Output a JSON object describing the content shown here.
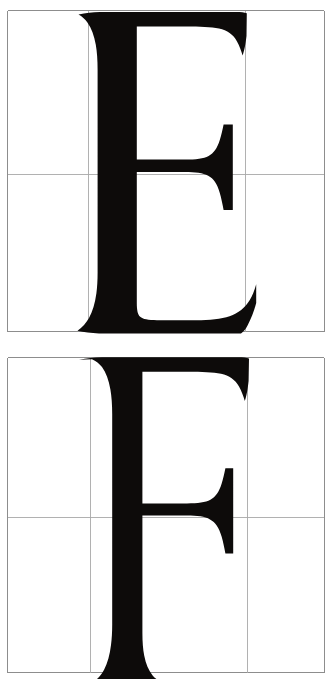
{
  "document": {
    "kind": "letterform-construction-plate",
    "title": "Roman capital construction plates",
    "background_color": "#ffffff",
    "ink_color": "#0d0b0a",
    "grid_color": "#8d8d8d",
    "panel_count": 2
  },
  "panels": [
    {
      "id": "plate-e",
      "letter": "E",
      "letter_name": "capital-e",
      "caption": "",
      "grid": {
        "outer_left": 7,
        "outer_right": 324,
        "outer_top": 10,
        "outer_bottom": 331,
        "vertical_rules": [
          7,
          88,
          245,
          324
        ],
        "horizontal_rules": [
          10,
          174,
          331
        ],
        "columns": 3,
        "rows": 2
      },
      "glyph_metrics": {
        "cap_height_top": 12,
        "baseline": 332,
        "stem_left": 97,
        "stem_right": 136,
        "top_arm_extent": 247,
        "mid_arm_extent": 233,
        "bottom_arm_extent": 256
      }
    },
    {
      "id": "plate-f",
      "letter": "F",
      "letter_name": "capital-f",
      "caption": "",
      "grid": {
        "outer_left": 7,
        "outer_right": 324,
        "outer_top": 357,
        "outer_bottom": 672,
        "vertical_rules": [
          7,
          90,
          247,
          324
        ],
        "horizontal_rules": [
          357,
          517,
          672
        ],
        "columns": 3,
        "rows": 2
      },
      "glyph_metrics": {
        "cap_height_top": 358,
        "baseline": 679,
        "stem_left": 107,
        "stem_right": 142,
        "top_arm_extent": 249,
        "mid_arm_extent": 233
      }
    }
  ]
}
